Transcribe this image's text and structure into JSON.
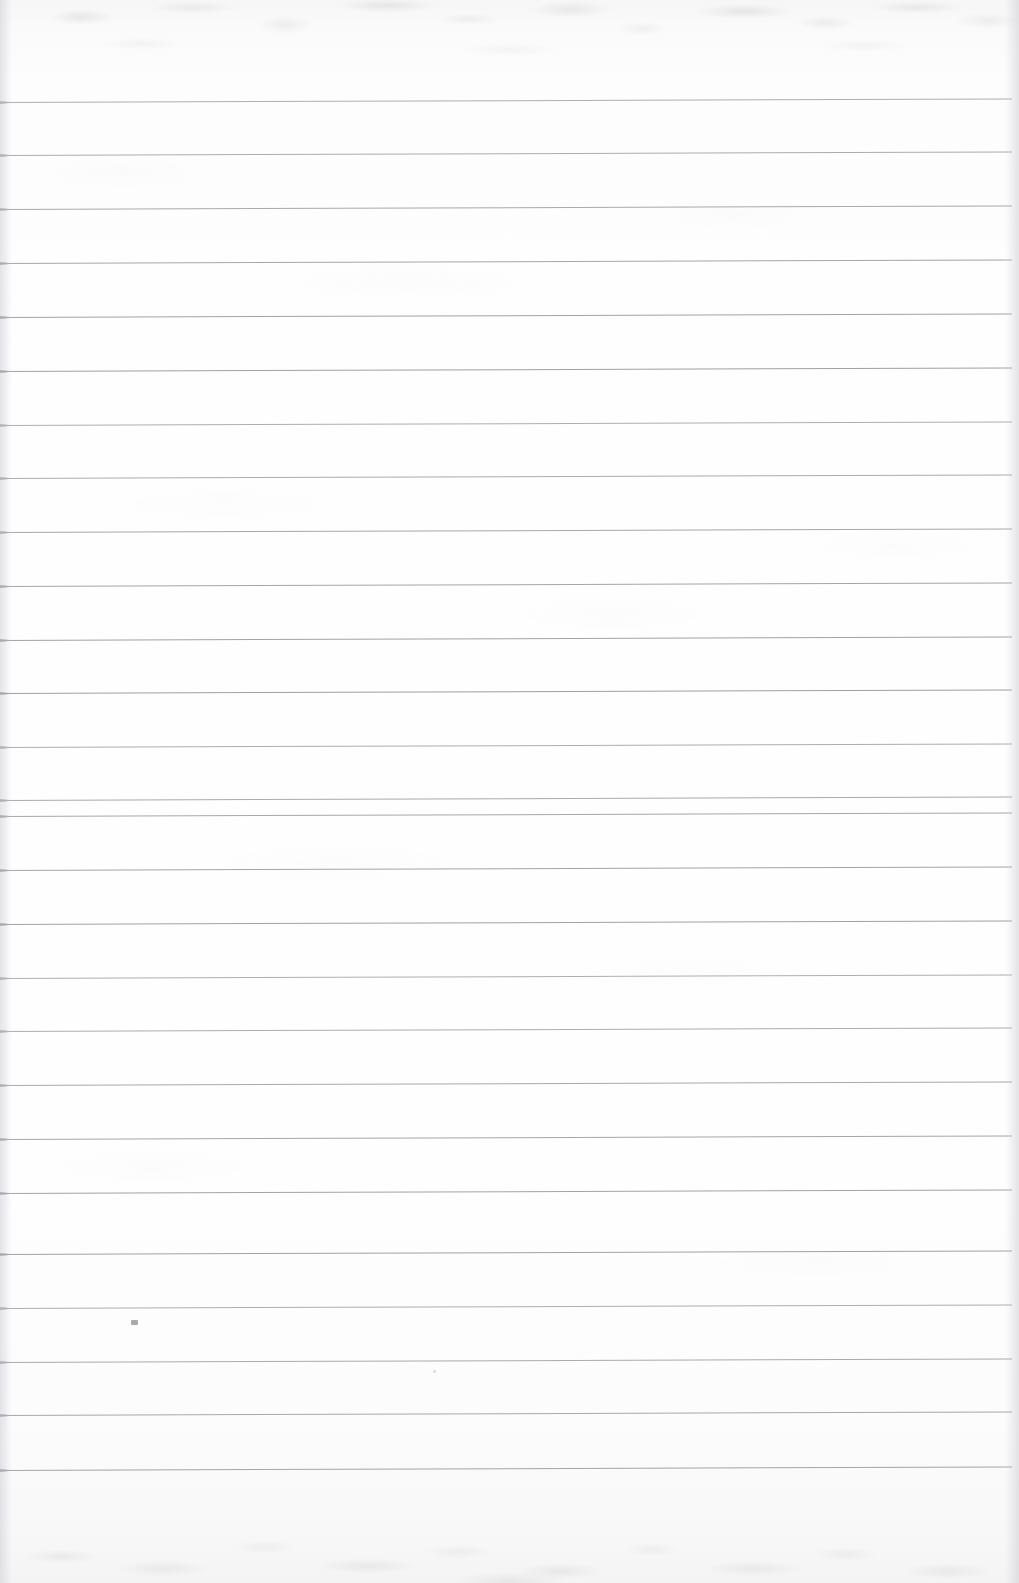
{
  "document": {
    "kind": "scanned-blank-ruled-notebook-page",
    "title": "Blank Lined Notebook Page",
    "page_text": "",
    "visible_text": "",
    "written_content": "none — page is blank",
    "width_px": 1019,
    "height_px": 1583
  },
  "paper": {
    "background_color": "#fdfdfe",
    "top_margin_px": 102,
    "bottom_margin_px": 113,
    "left_margin_px": 0,
    "right_margin_px": 7,
    "texture": "scanner grain / mottled gray at top and bottom edges",
    "edge_shadow_left": "#cdced3",
    "edge_shadow_right": "#c8c9cf"
  },
  "ruling": {
    "type": "wide-ruled horizontal lines",
    "line_color": "#9b9ba1",
    "line_thickness_px": 1,
    "line_count": 26,
    "line_spacing_px": 53.6,
    "first_line_y": 102,
    "last_line_y": 1470,
    "line_start_x": 0,
    "line_end_x": 1012,
    "skew_description": "lines rise very slightly toward the right edge",
    "skew_rise_px": 3.5,
    "line_y_positions": [
      102,
      155,
      209,
      263,
      317,
      371,
      425,
      478,
      532,
      586,
      640,
      693,
      747,
      800,
      816,
      870,
      924,
      978,
      1031,
      1085,
      1139,
      1193,
      1254,
      1308,
      1362,
      1415,
      1470
    ]
  },
  "marks": [
    {
      "name": "pencil-smudge",
      "description": "tiny faint pencil smudge below the 23rd rule",
      "x": 131,
      "y": 1320,
      "width": 7,
      "height": 5,
      "color": "#8d8d93"
    },
    {
      "name": "pencil-dot",
      "description": "very faint pencil dot below the 24th rule",
      "x": 433,
      "y": 1370,
      "width": 3,
      "height": 3,
      "color": "#a9a9af"
    }
  ]
}
